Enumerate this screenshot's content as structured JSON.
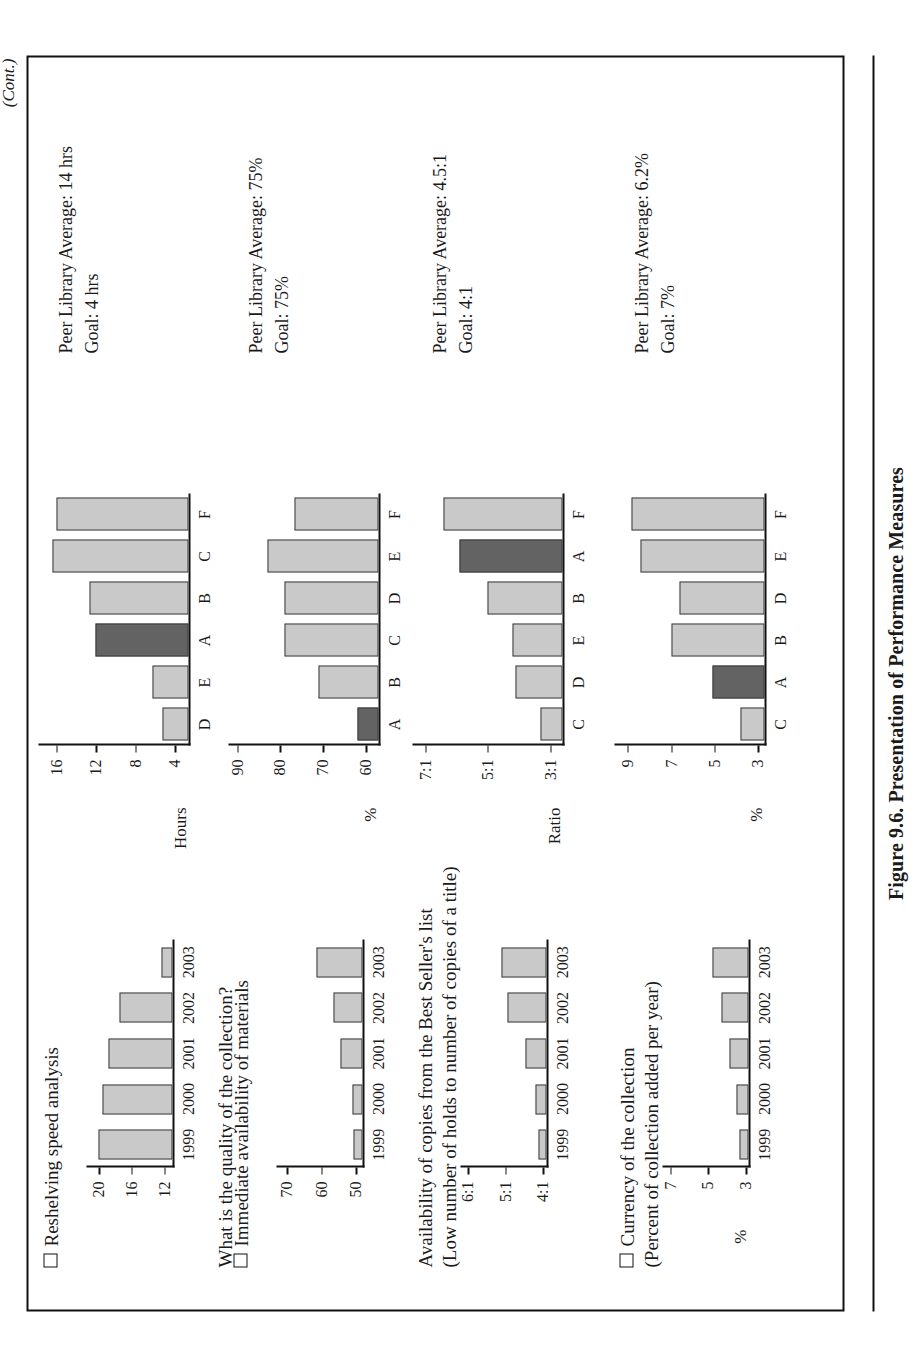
{
  "page": {
    "continued_note": "(Cont.)",
    "caption": "Figure 9.6. Presentation of Performance Measures"
  },
  "sections": [
    {
      "id": "reshelving",
      "title": "Reshelving speed analysis",
      "subtitle": "",
      "question": "What is the quality of the collection?",
      "peer_average": "Peer Library Average: 14 hrs",
      "goal": "Goal: 4 hrs",
      "trend": {
        "type": "bar",
        "ylabel": "",
        "categories": [
          "1999",
          "2000",
          "2001",
          "2002",
          "2003"
        ],
        "values": [
          20.0,
          19.6,
          18.8,
          17.5,
          12.4
        ],
        "ticks": [
          12,
          16,
          20
        ],
        "ylim": [
          11,
          21.5
        ],
        "title": "Reshelving speed analysis"
      },
      "benchmark": {
        "type": "bar",
        "ylabel": "Hours",
        "categories": [
          "D",
          "E",
          "A",
          "B",
          "C",
          "F"
        ],
        "values": [
          5.2,
          6.2,
          12.0,
          12.6,
          16.4,
          16.0
        ],
        "highlight": "A",
        "ticks": [
          4,
          8,
          12,
          16
        ],
        "ylim": [
          2.6,
          17.8
        ]
      }
    },
    {
      "id": "availability-materials",
      "title": "Immediate availability of materials",
      "subtitle": "",
      "question": "",
      "peer_average": "Peer Library Average: 75%",
      "goal": "Goal: 75%",
      "trend": {
        "type": "bar",
        "ylabel": "",
        "categories": [
          "1999",
          "2000",
          "2001",
          "2002",
          "2003"
        ],
        "values": [
          50.5,
          51.0,
          54.5,
          56.5,
          61.5
        ],
        "ticks": [
          50,
          60,
          70
        ],
        "ylim": [
          48,
          73
        ],
        "title": "Immediate availability of materials"
      },
      "benchmark": {
        "type": "bar",
        "ylabel": "%",
        "categories": [
          "A",
          "B",
          "C",
          "D",
          "E",
          "F"
        ],
        "values": [
          62.0,
          71.0,
          79.0,
          79.0,
          83.0,
          76.5
        ],
        "highlight": "A",
        "ticks": [
          60,
          70,
          80,
          90
        ],
        "ylim": [
          57,
          92
        ]
      }
    },
    {
      "id": "best-seller-copies",
      "title": "Availability of copies from the Best Seller's list",
      "subtitle": "(Low number of  holds to number of copies of a title)",
      "question": "",
      "peer_average": "Peer Library Average: 4.5:1",
      "goal": "Goal: 4:1",
      "trend": {
        "type": "bar",
        "ylabel": "",
        "categories": [
          "1999",
          "2000",
          "2001",
          "2002",
          "2003"
        ],
        "values": [
          4.12,
          4.2,
          4.45,
          4.95,
          5.1
        ],
        "ticks": [
          "4:1",
          "5:1",
          "6:1"
        ],
        "tickvals": [
          4,
          5,
          6
        ],
        "ylim": [
          3.9,
          6.2
        ],
        "title": "Availability of copies from the Best Seller's list"
      },
      "benchmark": {
        "type": "bar",
        "ylabel": "Ratio",
        "categories": [
          "C",
          "D",
          "E",
          "B",
          "A",
          "F"
        ],
        "values": [
          3.3,
          4.1,
          4.2,
          5.0,
          5.9,
          6.4
        ],
        "highlight": "A",
        "ticks": [
          "3:1",
          "5:1",
          "7:1"
        ],
        "tickvals": [
          3,
          5,
          7
        ],
        "ylim": [
          2.6,
          7.4
        ]
      }
    },
    {
      "id": "currency-collection",
      "title": "Currency of the collection",
      "subtitle": "(Percent of collection added per year)",
      "question": "",
      "peer_average": "Peer Library Average: 6.2%",
      "goal": "Goal: 7%",
      "trend": {
        "type": "bar",
        "ylabel": "%",
        "categories": [
          "1999",
          "2000",
          "2001",
          "2002",
          "2003"
        ],
        "values": [
          3.35,
          3.5,
          3.85,
          4.3,
          4.75
        ],
        "ticks": [
          3,
          5,
          7
        ],
        "ylim": [
          2.85,
          7.4
        ],
        "title": "Currency of the collection"
      },
      "benchmark": {
        "type": "bar",
        "ylabel": "%",
        "categories": [
          "C",
          "A",
          "B",
          "D",
          "E",
          "F"
        ],
        "values": [
          3.8,
          5.1,
          7.0,
          6.6,
          8.4,
          8.8
        ],
        "highlight": "A",
        "ticks": [
          3,
          5,
          7,
          9
        ],
        "ylim": [
          2.7,
          9.6
        ]
      }
    }
  ],
  "colors": {
    "bar_fill": "#c9c9c9",
    "bar_highlight": "#636363",
    "bar_stroke": "#3a3a3a",
    "axis": "#111111",
    "text": "#1a1a1a"
  },
  "chart_data": {
    "type": "bar",
    "title": "Figure 9.6. Presentation of Performance Measures",
    "charts": [
      {
        "name": "Reshelving speed analysis (trend)",
        "type": "bar",
        "xlabel": "",
        "ylabel": "",
        "categories": [
          "1999",
          "2000",
          "2001",
          "2002",
          "2003"
        ],
        "values": [
          20.0,
          19.6,
          18.8,
          17.5,
          12.4
        ],
        "ylim": [
          11,
          21.5
        ],
        "yticks": [
          12,
          16,
          20
        ],
        "grid": false,
        "legend": "none"
      },
      {
        "name": "Reshelving speed analysis (peer benchmark)",
        "type": "bar",
        "xlabel": "",
        "ylabel": "Hours",
        "categories": [
          "D",
          "E",
          "A",
          "B",
          "C",
          "F"
        ],
        "values": [
          5.2,
          6.2,
          12.0,
          12.6,
          16.4,
          16.0
        ],
        "highlight": "A",
        "ylim": [
          2.6,
          17.8
        ],
        "yticks": [
          4,
          8,
          12,
          16
        ],
        "annotations": [
          "Peer Library Average: 14 hrs",
          "Goal: 4 hrs"
        ],
        "grid": false,
        "legend": "none"
      },
      {
        "name": "Immediate availability of materials (trend)",
        "type": "bar",
        "xlabel": "",
        "ylabel": "",
        "categories": [
          "1999",
          "2000",
          "2001",
          "2002",
          "2003"
        ],
        "values": [
          50.5,
          51.0,
          54.5,
          56.5,
          61.5
        ],
        "ylim": [
          48,
          73
        ],
        "yticks": [
          50,
          60,
          70
        ],
        "grid": false,
        "legend": "none"
      },
      {
        "name": "Immediate availability of materials (peer benchmark)",
        "type": "bar",
        "xlabel": "",
        "ylabel": "%",
        "categories": [
          "A",
          "B",
          "C",
          "D",
          "E",
          "F"
        ],
        "values": [
          62.0,
          71.0,
          79.0,
          79.0,
          83.0,
          76.5
        ],
        "highlight": "A",
        "ylim": [
          57,
          92
        ],
        "yticks": [
          60,
          70,
          80,
          90
        ],
        "annotations": [
          "Peer Library Average: 75%",
          "Goal: 75%"
        ],
        "grid": false,
        "legend": "none"
      },
      {
        "name": "Availability of copies from the Best Seller's list (trend)",
        "type": "bar",
        "xlabel": "",
        "ylabel": "",
        "categories": [
          "1999",
          "2000",
          "2001",
          "2002",
          "2003"
        ],
        "values": [
          4.12,
          4.2,
          4.45,
          4.95,
          5.1
        ],
        "ylim": [
          3.9,
          6.2
        ],
        "yticks": [
          "4:1",
          "5:1",
          "6:1"
        ],
        "grid": false,
        "legend": "none"
      },
      {
        "name": "Availability of copies from the Best Seller's list (peer benchmark)",
        "type": "bar",
        "xlabel": "",
        "ylabel": "Ratio",
        "categories": [
          "C",
          "D",
          "E",
          "B",
          "A",
          "F"
        ],
        "values": [
          3.3,
          4.1,
          4.2,
          5.0,
          5.9,
          6.4
        ],
        "highlight": "A",
        "ylim": [
          2.6,
          7.4
        ],
        "yticks": [
          "3:1",
          "5:1",
          "7:1"
        ],
        "annotations": [
          "Peer Library Average: 4.5:1",
          "Goal: 4:1"
        ],
        "grid": false,
        "legend": "none"
      },
      {
        "name": "Currency of the collection (trend)",
        "type": "bar",
        "xlabel": "",
        "ylabel": "%",
        "categories": [
          "1999",
          "2000",
          "2001",
          "2002",
          "2003"
        ],
        "values": [
          3.35,
          3.5,
          3.85,
          4.3,
          4.75
        ],
        "ylim": [
          2.85,
          7.4
        ],
        "yticks": [
          3,
          5,
          7
        ],
        "grid": false,
        "legend": "none"
      },
      {
        "name": "Currency of the collection (peer benchmark)",
        "type": "bar",
        "xlabel": "",
        "ylabel": "%",
        "categories": [
          "C",
          "A",
          "B",
          "D",
          "E",
          "F"
        ],
        "values": [
          3.8,
          5.1,
          7.0,
          6.6,
          8.4,
          8.8
        ],
        "highlight": "A",
        "ylim": [
          2.7,
          9.6
        ],
        "yticks": [
          3,
          5,
          7,
          9
        ],
        "annotations": [
          "Peer Library Average: 6.2%",
          "Goal: 7%"
        ],
        "grid": false,
        "legend": "none"
      }
    ]
  }
}
